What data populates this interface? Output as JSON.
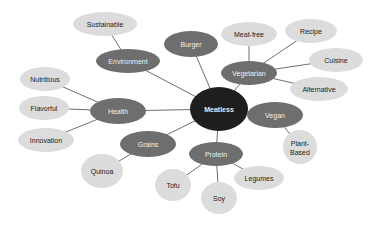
{
  "diagram": {
    "type": "mind-map",
    "colors": {
      "root_fill": "#1e1e1e",
      "category_fill": "#6e6e6e",
      "leaf_fill": "#dcdcdc",
      "edge": "#6f6f6f"
    },
    "root": {
      "id": "meatless",
      "label": "Meatless",
      "cx": 219,
      "cy": 109,
      "rx": 29,
      "ry": 22
    },
    "categories": [
      {
        "id": "environment",
        "label": "Environment",
        "cx": 128,
        "cy": 61,
        "rx": 32,
        "ry": 12
      },
      {
        "id": "burger",
        "label": "Burger",
        "cx": 191,
        "cy": 44,
        "rx": 27,
        "ry": 13
      },
      {
        "id": "vegetarian",
        "label": "Vegetarian",
        "cx": 249,
        "cy": 73,
        "rx": 28,
        "ry": 12
      },
      {
        "id": "vegan",
        "label": "Vegan",
        "cx": 275,
        "cy": 115,
        "rx": 28,
        "ry": 13
      },
      {
        "id": "health",
        "label": "Health",
        "cx": 118,
        "cy": 111,
        "rx": 28,
        "ry": 13
      },
      {
        "id": "grains",
        "label": "Grains",
        "cx": 148,
        "cy": 144,
        "rx": 28,
        "ry": 13
      },
      {
        "id": "protein",
        "label": "Protein",
        "cx": 216,
        "cy": 154,
        "rx": 27,
        "ry": 12
      }
    ],
    "leaves": [
      {
        "id": "sustainable",
        "label": "Sustainable",
        "parent": "environment",
        "cx": 105,
        "cy": 24,
        "rx": 32,
        "ry": 12
      },
      {
        "id": "meat-free",
        "label": "Meat-free",
        "parent": "vegetarian",
        "cx": 249,
        "cy": 34,
        "rx": 28,
        "ry": 12
      },
      {
        "id": "recipe",
        "label": "Recipe",
        "parent": "vegetarian",
        "cx": 311,
        "cy": 31,
        "rx": 26,
        "ry": 12
      },
      {
        "id": "cuisine",
        "label": "Cuisine",
        "parent": "vegetarian",
        "cx": 336,
        "cy": 60,
        "rx": 27,
        "ry": 12
      },
      {
        "id": "alternative",
        "label": "Alternative",
        "parent": "vegetarian",
        "cx": 319,
        "cy": 89,
        "rx": 29,
        "ry": 12
      },
      {
        "id": "nutritious",
        "label": "Nutritious",
        "parent": "health",
        "cx": 45,
        "cy": 79,
        "rx": 25,
        "ry": 12
      },
      {
        "id": "flavorful",
        "label": "Flavorful",
        "parent": "health",
        "cx": 44,
        "cy": 108,
        "rx": 25,
        "ry": 12
      },
      {
        "id": "innovation",
        "label": "Innovation",
        "parent": "health",
        "cx": 46,
        "cy": 140,
        "rx": 28,
        "ry": 12
      },
      {
        "id": "quinoa",
        "label": "Quinoa",
        "parent": "grains",
        "cx": 102,
        "cy": 171,
        "rx": 21,
        "ry": 17
      },
      {
        "id": "tofu",
        "label": "Tofu",
        "parent": "protein",
        "cx": 173,
        "cy": 185,
        "rx": 18,
        "ry": 16
      },
      {
        "id": "soy",
        "label": "Soy",
        "parent": "protein",
        "cx": 219,
        "cy": 198,
        "rx": 18,
        "ry": 16
      },
      {
        "id": "legumes",
        "label": "Legumes",
        "parent": "protein",
        "cx": 259,
        "cy": 178,
        "rx": 25,
        "ry": 12
      },
      {
        "id": "plant-based",
        "label": "Plant-Based",
        "label_lines": [
          "Plant-",
          "Based"
        ],
        "parent": "vegan",
        "cx": 300,
        "cy": 147,
        "rx": 17,
        "ry": 17
      }
    ],
    "edges": [
      {
        "from": "meatless",
        "to": "environment",
        "x1": 219,
        "y1": 109,
        "x2": 128,
        "y2": 61
      },
      {
        "from": "meatless",
        "to": "burger",
        "x1": 219,
        "y1": 109,
        "x2": 191,
        "y2": 44
      },
      {
        "from": "meatless",
        "to": "vegetarian",
        "x1": 219,
        "y1": 109,
        "x2": 249,
        "y2": 73
      },
      {
        "from": "meatless",
        "to": "vegan",
        "x1": 219,
        "y1": 109,
        "x2": 275,
        "y2": 115
      },
      {
        "from": "meatless",
        "to": "health",
        "x1": 219,
        "y1": 109,
        "x2": 118,
        "y2": 111
      },
      {
        "from": "meatless",
        "to": "grains",
        "x1": 219,
        "y1": 109,
        "x2": 148,
        "y2": 144
      },
      {
        "from": "meatless",
        "to": "protein",
        "x1": 219,
        "y1": 109,
        "x2": 216,
        "y2": 154
      },
      {
        "from": "environment",
        "to": "sustainable",
        "x1": 128,
        "y1": 61,
        "x2": 105,
        "y2": 24
      },
      {
        "from": "vegetarian",
        "to": "meat-free",
        "x1": 249,
        "y1": 73,
        "x2": 249,
        "y2": 34
      },
      {
        "from": "vegetarian",
        "to": "recipe",
        "x1": 249,
        "y1": 73,
        "x2": 311,
        "y2": 31
      },
      {
        "from": "vegetarian",
        "to": "cuisine",
        "x1": 249,
        "y1": 73,
        "x2": 336,
        "y2": 60
      },
      {
        "from": "vegetarian",
        "to": "alternative",
        "x1": 249,
        "y1": 73,
        "x2": 319,
        "y2": 89
      },
      {
        "from": "health",
        "to": "nutritious",
        "x1": 118,
        "y1": 111,
        "x2": 45,
        "y2": 79
      },
      {
        "from": "health",
        "to": "flavorful",
        "x1": 118,
        "y1": 111,
        "x2": 44,
        "y2": 108
      },
      {
        "from": "health",
        "to": "innovation",
        "x1": 118,
        "y1": 111,
        "x2": 46,
        "y2": 140
      },
      {
        "from": "grains",
        "to": "quinoa",
        "x1": 148,
        "y1": 144,
        "x2": 102,
        "y2": 171
      },
      {
        "from": "protein",
        "to": "tofu",
        "x1": 216,
        "y1": 154,
        "x2": 173,
        "y2": 185
      },
      {
        "from": "protein",
        "to": "soy",
        "x1": 216,
        "y1": 154,
        "x2": 219,
        "y2": 198
      },
      {
        "from": "protein",
        "to": "legumes",
        "x1": 216,
        "y1": 154,
        "x2": 259,
        "y2": 178
      },
      {
        "from": "vegan",
        "to": "plant-based",
        "x1": 275,
        "y1": 115,
        "x2": 300,
        "y2": 147
      }
    ]
  }
}
